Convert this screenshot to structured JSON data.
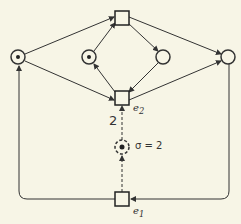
{
  "diagram": {
    "type": "petri-net",
    "colors": {
      "background": "#f7f5e6",
      "stroke": "#333333"
    },
    "places": [
      {
        "id": "p1",
        "tokens": 1
      },
      {
        "id": "p2",
        "tokens": 1
      },
      {
        "id": "p3",
        "tokens": 0
      },
      {
        "id": "p4",
        "tokens": 0
      },
      {
        "id": "p5",
        "tokens": 1,
        "dashed": true
      }
    ],
    "transitions": [
      {
        "id": "t_top",
        "label": ""
      },
      {
        "id": "e2",
        "label": "e2"
      },
      {
        "id": "e1",
        "label": "e1"
      }
    ],
    "labels": {
      "e2": "e",
      "e2_sub": "2",
      "e1": "e",
      "e1_sub": "1",
      "arc_weight": "2",
      "sigma": "σ = 2"
    }
  }
}
